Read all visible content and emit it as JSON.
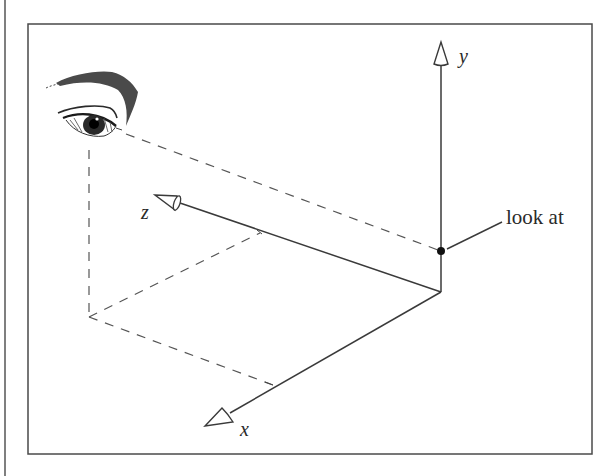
{
  "diagram": {
    "type": "3d-camera-lookat",
    "colors": {
      "line": "#3a3a3a",
      "dash": "#555555",
      "frame": "#4a4a4a",
      "background": "#ffffff",
      "ink": "#1a1a1a"
    },
    "axes": {
      "y": {
        "label": "y"
      },
      "z": {
        "label": "z"
      },
      "x": {
        "label": "x"
      }
    },
    "annotation": {
      "label": "look at"
    },
    "eye": {
      "name": "viewer-eye"
    }
  }
}
